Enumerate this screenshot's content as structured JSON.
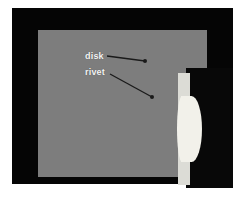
{
  "figure": {
    "colors": {
      "page_background": "#ffffff",
      "frame_black": "#050505",
      "specimen_gray": "#7d7d7d",
      "cavity_black": "#080808",
      "disk_light": "#dcdcd6",
      "rivet_light": "#f2f1ea",
      "label_text": "#f4f4f4",
      "leader_line": "#1a1a1a"
    },
    "annotations": [
      {
        "id": "disk",
        "label": "disk",
        "label_x": 85,
        "label_y": 51,
        "leader_from_x": 107,
        "leader_from_y": 56,
        "leader_to_x": 145,
        "leader_to_y": 61,
        "marker": "dot"
      },
      {
        "id": "rivet",
        "label": "rivet",
        "label_x": 85,
        "label_y": 67,
        "leader_from_x": 110,
        "leader_from_y": 74,
        "leader_to_x": 152,
        "leader_to_y": 97,
        "marker": "dot"
      }
    ],
    "parts": [
      {
        "id": "disk",
        "name": "disk",
        "shape": "vertical-bar"
      },
      {
        "id": "rivet",
        "name": "rivet",
        "shape": "lens-bulge"
      }
    ]
  }
}
